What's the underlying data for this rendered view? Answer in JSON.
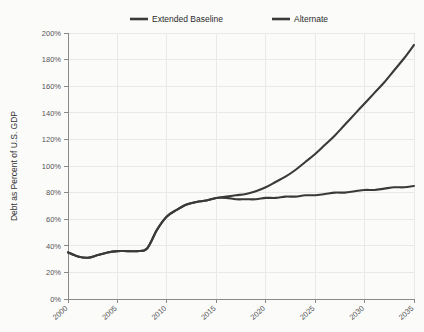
{
  "chart_data": {
    "type": "line",
    "title": "",
    "xlabel": "",
    "ylabel": "Debt as Percent of U.S. GDP",
    "xlim": [
      2000,
      2035
    ],
    "ylim": [
      0,
      200
    ],
    "grid": true,
    "legend_position": "top",
    "x_tick_labels": [
      "2000",
      "2005",
      "2010",
      "2015",
      "2020",
      "2025",
      "2030",
      "2035"
    ],
    "x_ticks": [
      2000,
      2005,
      2010,
      2015,
      2020,
      2025,
      2030,
      2035
    ],
    "y_tick_labels": [
      "0%",
      "20%",
      "40%",
      "60%",
      "80%",
      "100%",
      "120%",
      "140%",
      "160%",
      "180%",
      "200%"
    ],
    "y_ticks": [
      0,
      20,
      40,
      60,
      80,
      100,
      120,
      140,
      160,
      180,
      200
    ],
    "series": [
      {
        "name": "Extended Baseline",
        "color": "#3a3a3a",
        "x": [
          2000,
          2001,
          2002,
          2003,
          2004,
          2005,
          2006,
          2007,
          2008,
          2009,
          2010,
          2011,
          2012,
          2013,
          2014,
          2015,
          2016,
          2017,
          2018,
          2019,
          2020,
          2021,
          2022,
          2023,
          2024,
          2025,
          2026,
          2027,
          2028,
          2029,
          2030,
          2031,
          2032,
          2033,
          2034,
          2035
        ],
        "values": [
          35,
          32,
          31,
          33,
          35,
          36,
          36,
          36,
          38,
          52,
          62,
          67,
          71,
          73,
          74,
          76,
          77,
          78,
          79,
          81,
          84,
          88,
          92,
          97,
          103,
          109,
          116,
          123,
          131,
          139,
          147,
          155,
          163,
          172,
          181,
          191
        ]
      },
      {
        "name": "Alternate",
        "color": "#3a3a3a",
        "x": [
          2000,
          2001,
          2002,
          2003,
          2004,
          2005,
          2006,
          2007,
          2008,
          2009,
          2010,
          2011,
          2012,
          2013,
          2014,
          2015,
          2016,
          2017,
          2018,
          2019,
          2020,
          2021,
          2022,
          2023,
          2024,
          2025,
          2026,
          2027,
          2028,
          2029,
          2030,
          2031,
          2032,
          2033,
          2034,
          2035
        ],
        "values": [
          35,
          32,
          31,
          33,
          35,
          36,
          36,
          36,
          38,
          52,
          62,
          67,
          71,
          73,
          74,
          76,
          76,
          75,
          75,
          75,
          76,
          76,
          77,
          77,
          78,
          78,
          79,
          80,
          80,
          81,
          82,
          82,
          83,
          84,
          84,
          85
        ]
      }
    ]
  },
  "legend": {
    "items": [
      {
        "label": "Extended Baseline"
      },
      {
        "label": "Alternate"
      }
    ]
  },
  "axes": {
    "y_title": "Debt as Percent of U.S. GDP"
  }
}
